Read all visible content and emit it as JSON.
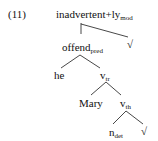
{
  "example": {
    "number": "(11)"
  },
  "tree": {
    "root": {
      "label": "inadvertent+ly",
      "sub": "mod"
    },
    "root_right": {
      "label": "√",
      "sub": ""
    },
    "offend": {
      "label": "offend",
      "sub": "pred"
    },
    "he": {
      "label": "he",
      "sub": ""
    },
    "v_tr": {
      "label": "v",
      "sub": "tr"
    },
    "mary": {
      "label": "Mary",
      "sub": ""
    },
    "v_th": {
      "label": "v",
      "sub": "th"
    },
    "n_det": {
      "label": "n",
      "sub": "det"
    },
    "leaf_root": {
      "label": "√",
      "sub": ""
    }
  },
  "edges": [
    {
      "from": "root",
      "to": "offend",
      "style": "vertical"
    },
    {
      "from": "root",
      "to": "root_right"
    },
    {
      "from": "offend",
      "to": "he"
    },
    {
      "from": "offend",
      "to": "v_tr"
    },
    {
      "from": "v_tr",
      "to": "mary"
    },
    {
      "from": "v_tr",
      "to": "v_th"
    },
    {
      "from": "v_th",
      "to": "n_det"
    },
    {
      "from": "v_th",
      "to": "leaf_root"
    }
  ]
}
